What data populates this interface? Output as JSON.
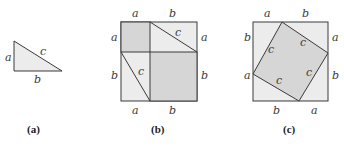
{
  "colors": {
    "stroke": "#3a3a3a",
    "light_fill": "#ececec",
    "dark_fill": "#d6d6d6",
    "background": "#ffffff"
  },
  "figure_a": {
    "caption": "(a)",
    "labels": {
      "side_a": "a",
      "side_b": "b",
      "hypotenuse": "c"
    }
  },
  "figure_b": {
    "caption": "(b)",
    "top_labels": [
      "a",
      "b"
    ],
    "bottom_labels": [
      "a",
      "b"
    ],
    "left_labels": [
      "a",
      "b"
    ],
    "right_labels": [
      "a",
      "b"
    ],
    "inner_labels": [
      "c",
      "c"
    ]
  },
  "figure_c": {
    "caption": "(c)",
    "top_labels": [
      "a",
      "b"
    ],
    "bottom_labels": [
      "b",
      "a"
    ],
    "left_labels": [
      "b",
      "a"
    ],
    "right_labels": [
      "a",
      "b"
    ],
    "inner_labels": [
      "c",
      "c",
      "c",
      "c"
    ]
  }
}
